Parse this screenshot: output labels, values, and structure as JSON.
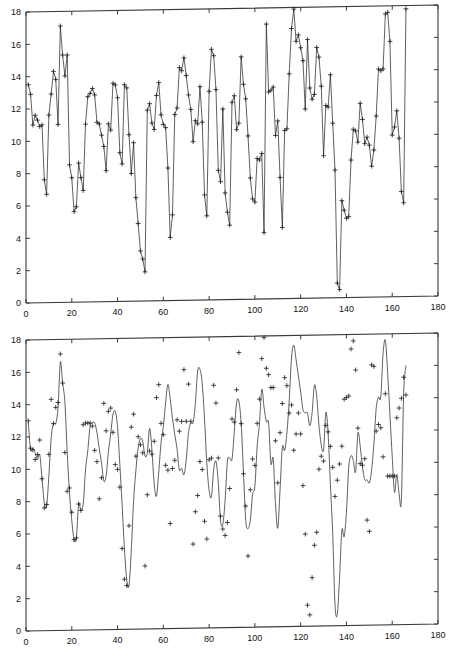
{
  "figure": {
    "background": "#ffffff",
    "line_color": "#2b2b2b",
    "axis_color": "#3a3a3a",
    "marker_symbol": "+"
  },
  "chart_data": [
    {
      "id": "top",
      "type": "line",
      "title": "",
      "xlabel": "",
      "ylabel": "",
      "xlim": [
        0,
        180
      ],
      "ylim": [
        0,
        18
      ],
      "xticks": [
        0,
        20,
        40,
        60,
        80,
        100,
        120,
        140,
        160,
        180
      ],
      "yticks": [
        0,
        2,
        4,
        6,
        8,
        10,
        12,
        14,
        16,
        18
      ],
      "xtick_labels": [
        "0",
        "20",
        "40",
        "60",
        "80",
        "100",
        "120",
        "140",
        "160",
        "180"
      ],
      "ytick_labels": [
        "0",
        "2",
        "4",
        "6",
        "8",
        "10",
        "12",
        "14",
        "16",
        "18"
      ],
      "grid": false,
      "legend": null,
      "markers": true,
      "marker_symbol": "+",
      "connect_points": true,
      "smoothed": false,
      "series": [
        {
          "name": "observed",
          "x": [
            1,
            2,
            3,
            4,
            5,
            6,
            7,
            8,
            9,
            10,
            11,
            12,
            13,
            14,
            15,
            16,
            17,
            18,
            19,
            20,
            21,
            22,
            23,
            24,
            25,
            26,
            27,
            28,
            29,
            30,
            31,
            32,
            33,
            34,
            35,
            36,
            37,
            38,
            39,
            40,
            41,
            42,
            43,
            44,
            45,
            46,
            47,
            48,
            49,
            50,
            51,
            52,
            53,
            54,
            55,
            56,
            57,
            58,
            59,
            60,
            61,
            62,
            63,
            64,
            65,
            66,
            67,
            68,
            69,
            70,
            71,
            72,
            73,
            74,
            75,
            76,
            77,
            78,
            79,
            80,
            81,
            82,
            83,
            84,
            85,
            86,
            87,
            88,
            89,
            90,
            91,
            92,
            93,
            94,
            95,
            96,
            97,
            98,
            99,
            100,
            101,
            102,
            103,
            104,
            105,
            106,
            107,
            108,
            109,
            110,
            111,
            112,
            113,
            114,
            115,
            116,
            117,
            118,
            119,
            120,
            121,
            122,
            123,
            124,
            125,
            126,
            127,
            128,
            129,
            130,
            131,
            132,
            133,
            134,
            135,
            136,
            137,
            138,
            139,
            140,
            141,
            142,
            143,
            144,
            145,
            146,
            147,
            148,
            149,
            150,
            151,
            152,
            153,
            154,
            155,
            156,
            157,
            158,
            159,
            160,
            161,
            162,
            163,
            164,
            165,
            166
          ],
          "values": [
            13.5,
            12.9,
            11.0,
            11.6,
            11.3,
            10.9,
            11.0,
            7.6,
            6.7,
            11.6,
            12.9,
            14.3,
            13.8,
            11.0,
            17.1,
            15.3,
            14.0,
            15.3,
            8.5,
            7.7,
            5.6,
            5.9,
            8.6,
            7.7,
            6.9,
            11.0,
            12.7,
            12.9,
            13.2,
            12.8,
            11.1,
            11.0,
            10.3,
            9.6,
            8.1,
            11.0,
            10.6,
            13.5,
            13.4,
            12.6,
            9.2,
            8.5,
            13.4,
            13.2,
            10.3,
            7.9,
            9.8,
            6.4,
            4.8,
            3.1,
            2.6,
            1.8,
            11.8,
            12.2,
            11.0,
            10.6,
            12.7,
            13.5,
            11.5,
            10.9,
            10.7,
            8.2,
            3.9,
            5.3,
            11.5,
            11.9,
            14.4,
            14.2,
            15.0,
            13.9,
            12.7,
            11.8,
            9.8,
            11.1,
            10.9,
            13.2,
            11.0,
            6.5,
            5.2,
            12.9,
            15.5,
            15.1,
            13.0,
            8.0,
            7.3,
            11.8,
            6.6,
            5.4,
            4.6,
            12.2,
            12.6,
            10.5,
            10.9,
            15.0,
            13.3,
            12.4,
            10.1,
            7.5,
            6.2,
            6.0,
            8.7,
            8.6,
            9.0,
            4.1,
            17.0,
            12.8,
            12.9,
            13.1,
            10.1,
            11.0,
            7.5,
            4.4,
            10.4,
            10.5,
            13.9,
            16.7,
            17.9,
            15.9,
            16.3,
            15.5,
            14.7,
            11.7,
            16.0,
            13.0,
            12.3,
            12.6,
            15.5,
            14.9,
            13.1,
            8.8,
            11.9,
            11.8,
            13.8,
            10.8,
            7.9,
            0.9,
            0.5,
            6.0,
            5.4,
            4.9,
            5.0,
            8.5,
            10.4,
            10.3,
            9.6,
            12.0,
            11.0,
            9.5,
            9.9,
            9.4,
            8.1,
            9.1,
            11.2,
            14.1,
            14.0,
            14.1,
            17.5,
            17.6,
            15.8,
            10.0,
            10.5,
            11.5,
            9.8,
            6.5,
            5.8,
            17.8,
            16.1,
            11.7,
            12.5,
            12.2,
            9.1,
            10.2,
            8.0,
            9.2,
            9.2,
            13.4,
            13.7,
            14.1,
            14.6,
            15.4,
            14.9
          ]
        }
      ]
    },
    {
      "id": "bottom",
      "type": "line",
      "title": "",
      "xlabel": "",
      "ylabel": "",
      "xlim": [
        0,
        180
      ],
      "ylim": [
        0,
        18
      ],
      "xticks": [
        0,
        20,
        40,
        60,
        80,
        100,
        120,
        140,
        160,
        180
      ],
      "yticks": [
        0,
        2,
        4,
        6,
        8,
        10,
        12,
        14,
        16,
        18
      ],
      "xtick_labels": [
        "0",
        "20",
        "40",
        "60",
        "80",
        "100",
        "120",
        "140",
        "160",
        "180"
      ],
      "ytick_labels": [
        "0",
        "2",
        "4",
        "6",
        "8",
        "10",
        "12",
        "14",
        "16",
        "18"
      ],
      "grid": false,
      "legend": null,
      "markers": true,
      "marker_symbol": "+",
      "connect_points": false,
      "smoothed": true,
      "series": [
        {
          "name": "fitted-curve",
          "x": [
            1,
            2,
            3,
            4,
            5,
            6,
            7,
            8,
            9,
            10,
            11,
            12,
            13,
            14,
            15,
            16,
            17,
            18,
            19,
            20,
            21,
            22,
            23,
            24,
            25,
            26,
            27,
            28,
            29,
            30,
            31,
            32,
            33,
            34,
            35,
            36,
            37,
            38,
            39,
            40,
            41,
            42,
            43,
            44,
            45,
            46,
            47,
            48,
            49,
            50,
            51,
            52,
            53,
            54,
            55,
            56,
            57,
            58,
            59,
            60,
            61,
            62,
            63,
            64,
            65,
            66,
            67,
            68,
            69,
            70,
            71,
            72,
            73,
            74,
            75,
            76,
            77,
            78,
            79,
            80,
            81,
            82,
            83,
            84,
            85,
            86,
            87,
            88,
            89,
            90,
            91,
            92,
            93,
            94,
            95,
            96,
            97,
            98,
            99,
            100,
            101,
            102,
            103,
            104,
            105,
            106,
            107,
            108,
            109,
            110,
            111,
            112,
            113,
            114,
            115,
            116,
            117,
            118,
            119,
            120,
            121,
            122,
            123,
            124,
            125,
            126,
            127,
            128,
            129,
            130,
            131,
            132,
            133,
            134,
            135,
            136,
            137,
            138,
            139,
            140,
            141,
            142,
            143,
            144,
            145,
            146,
            147,
            148,
            149,
            150,
            151,
            152,
            153,
            154,
            155,
            156,
            157,
            158,
            159,
            160,
            161,
            162,
            163,
            164,
            165,
            166
          ],
          "values": [
            12.9,
            11.2,
            11.3,
            11.0,
            10.6,
            10.9,
            9.4,
            7.9,
            7.7,
            9.6,
            11.9,
            12.8,
            12.8,
            13.8,
            16.6,
            15.3,
            14.1,
            11.0,
            8.5,
            6.8,
            5.6,
            5.7,
            7.8,
            7.4,
            7.8,
            9.9,
            11.1,
            12.6,
            12.8,
            12.8,
            12.2,
            11.2,
            10.3,
            9.2,
            9.5,
            11.0,
            12.1,
            13.3,
            13.5,
            12.5,
            10.2,
            7.7,
            5.0,
            3.1,
            2.7,
            4.9,
            7.9,
            9.8,
            11.2,
            11.8,
            11.6,
            10.7,
            10.9,
            12.4,
            11.1,
            9.0,
            8.2,
            9.7,
            11.5,
            12.5,
            14.0,
            15.1,
            14.2,
            13.0,
            12.0,
            11.1,
            9.8,
            9.9,
            9.5,
            10.4,
            12.1,
            12.7,
            12.7,
            13.9,
            15.9,
            16.0,
            15.1,
            12.9,
            10.2,
            8.5,
            8.1,
            9.8,
            10.3,
            9.0,
            6.6,
            6.4,
            7.9,
            10.3,
            10.5,
            10.4,
            12.1,
            13.9,
            14.0,
            12.6,
            9.6,
            6.6,
            6.1,
            6.6,
            8.2,
            8.7,
            11.2,
            12.6,
            14.7,
            13.6,
            12.7,
            12.6,
            10.1,
            10.4,
            7.6,
            6.1,
            8.5,
            11.1,
            10.9,
            12.0,
            14.0,
            16.6,
            17.4,
            16.5,
            15.5,
            14.5,
            13.4,
            13.2,
            13.2,
            12.4,
            13.2,
            14.9,
            14.2,
            12.4,
            11.2,
            10.9,
            13.2,
            11.9,
            8.7,
            5.7,
            1.3,
            0.7,
            3.0,
            5.9,
            5.5,
            7.0,
            9.8,
            10.5,
            10.2,
            9.5,
            11.9,
            11.1,
            9.8,
            9.0,
            9.0,
            8.8,
            9.6,
            11.2,
            13.4,
            14.1,
            14.1,
            16.8,
            17.6,
            15.6,
            13.0,
            10.4,
            8.2,
            9.3,
            8.1,
            7.7,
            14.3,
            16.0,
            13.5,
            12.2,
            12.2,
            10.4,
            10.1,
            9.2,
            9.2,
            9.2,
            7.8,
            12.5,
            13.4,
            14.0,
            15.3,
            14.2
          ]
        },
        {
          "name": "observed-markers",
          "x": [
            1,
            2,
            3,
            4,
            5,
            6,
            7,
            8,
            9,
            10,
            11,
            12,
            13,
            14,
            15,
            16,
            17,
            18,
            19,
            20,
            21,
            22,
            23,
            24,
            25,
            26,
            27,
            28,
            29,
            30,
            31,
            32,
            33,
            34,
            35,
            36,
            37,
            38,
            39,
            40,
            41,
            42,
            43,
            44,
            45,
            46,
            47,
            48,
            49,
            50,
            51,
            52,
            53,
            54,
            55,
            56,
            57,
            58,
            59,
            60,
            61,
            62,
            63,
            64,
            65,
            66,
            67,
            68,
            69,
            70,
            71,
            72,
            73,
            74,
            75,
            76,
            77,
            78,
            79,
            80,
            81,
            82,
            83,
            84,
            85,
            86,
            87,
            88,
            89,
            90,
            91,
            92,
            93,
            94,
            95,
            96,
            97,
            98,
            99,
            100,
            101,
            102,
            103,
            104,
            105,
            106,
            107,
            108,
            109,
            110,
            111,
            112,
            113,
            114,
            115,
            116,
            117,
            118,
            119,
            120,
            121,
            122,
            123,
            124,
            125,
            126,
            127,
            128,
            129,
            130,
            131,
            132,
            133,
            134,
            135,
            136,
            137,
            138,
            139,
            140,
            141,
            142,
            143,
            144,
            145,
            146,
            147,
            148,
            149,
            150,
            151,
            152,
            153,
            154,
            155,
            156,
            157,
            158,
            159,
            160,
            161,
            162,
            163,
            164,
            165,
            166
          ],
          "values": [
            13.0,
            11.3,
            11.2,
            10.6,
            10.9,
            11.8,
            9.4,
            7.6,
            7.8,
            10.9,
            14.3,
            12.8,
            13.8,
            14.1,
            17.1,
            15.3,
            11.0,
            8.6,
            8.8,
            7.3,
            5.6,
            5.7,
            7.8,
            7.4,
            12.7,
            12.8,
            12.8,
            12.8,
            12.6,
            11.1,
            10.4,
            8.1,
            9.4,
            14.0,
            12.3,
            13.5,
            13.7,
            12.2,
            10.2,
            9.9,
            8.8,
            5.0,
            3.1,
            2.7,
            6.4,
            12.5,
            13.3,
            10.7,
            11.9,
            11.4,
            10.9,
            3.9,
            8.3,
            11.0,
            10.8,
            11.6,
            14.3,
            15.1,
            12.7,
            12.0,
            10.1,
            9.8,
            6.5,
            9.9,
            10.4,
            12.9,
            12.2,
            12.8,
            16.0,
            12.8,
            15.1,
            12.8,
            5.2,
            7.2,
            8.2,
            10.3,
            9.8,
            6.6,
            5.5,
            10.4,
            10.5,
            15.0,
            13.9,
            10.5,
            6.9,
            6.1,
            5.7,
            6.5,
            8.6,
            12.9,
            12.7,
            14.7,
            17.0,
            12.6,
            9.5,
            7.5,
            4.4,
            8.5,
            10.4,
            10.0,
            12.6,
            14.1,
            16.6,
            17.9,
            16.0,
            15.6,
            14.8,
            14.8,
            11.5,
            8.9,
            12.0,
            13.8,
            15.4,
            14.9,
            13.2,
            13.7,
            10.9,
            11.9,
            13.2,
            11.9,
            8.7,
            5.7,
            1.3,
            0.7,
            3.0,
            5.0,
            5.8,
            9.7,
            10.5,
            10.2,
            12.4,
            12.0,
            11.1,
            9.8,
            8.0,
            9.0,
            10.0,
            11.1,
            14.0,
            14.1,
            14.2,
            17.1,
            17.6,
            15.8,
            12.2,
            10.0,
            9.9,
            10.3,
            6.5,
            5.8,
            16.1,
            16.0,
            12.0,
            12.4,
            12.2,
            10.4,
            14.3,
            9.2,
            9.2,
            9.2,
            9.2,
            12.8,
            13.4,
            14.0,
            15.3,
            14.2
          ]
        }
      ]
    }
  ]
}
